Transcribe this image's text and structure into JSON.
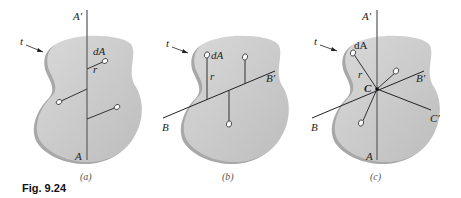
{
  "figure": {
    "label": "Fig. 9.24",
    "colors": {
      "plate_face": "#c9c9c9",
      "plate_edge": "#a8a8a8",
      "axis_line": "#6e6e6e",
      "radius_line": "#333333",
      "element_fill": "#ffffff"
    },
    "panels": [
      {
        "id": "a",
        "caption": "(a)",
        "labels": {
          "thickness": "t",
          "element": "dA",
          "radius": "r",
          "axis_top": "A′",
          "axis_bottom": "A"
        }
      },
      {
        "id": "b",
        "caption": "(b)",
        "labels": {
          "thickness": "t",
          "element": "dA",
          "radius": "r",
          "axis_right": "B′",
          "axis_left": "B"
        }
      },
      {
        "id": "c",
        "caption": "(c)",
        "labels": {
          "thickness": "t",
          "element": "dA",
          "radius": "r",
          "centroid": "C",
          "axis_top": "A′",
          "axis_bottom": "A",
          "axis_b_right": "B′",
          "axis_b_left": "B",
          "axis_c_right": "C′"
        }
      }
    ]
  }
}
